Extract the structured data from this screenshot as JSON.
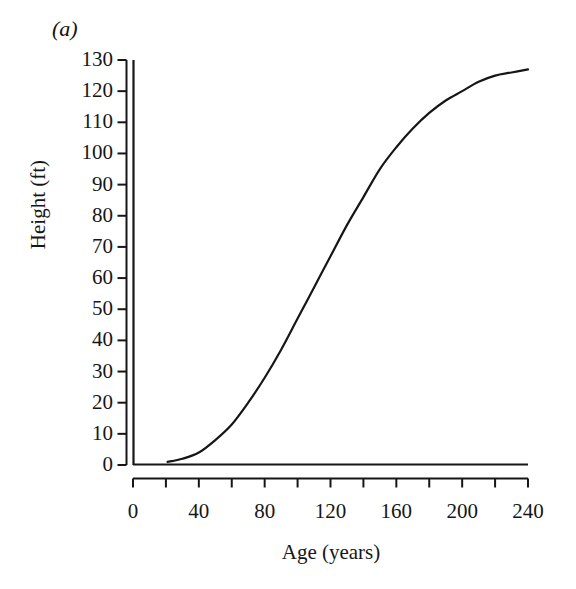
{
  "figure": {
    "panel_label": "(a)",
    "background": "#ffffff",
    "ink_color": "#161616"
  },
  "chart_data": {
    "type": "line",
    "title": "",
    "panel": "(a)",
    "xlabel": "Age (years)",
    "ylabel": "Height (ft)",
    "xlim": [
      0,
      240
    ],
    "ylim": [
      0,
      130
    ],
    "grid": false,
    "legend": null,
    "x_major_ticks": [
      0,
      40,
      80,
      120,
      160,
      200,
      240
    ],
    "x_minor_ticks": [
      20,
      60,
      100,
      140,
      180,
      220
    ],
    "x_tick_labels": [
      "0",
      "40",
      "80",
      "120",
      "160",
      "200",
      "240"
    ],
    "y_ticks": [
      0,
      10,
      20,
      30,
      40,
      50,
      60,
      70,
      80,
      90,
      100,
      110,
      120,
      130
    ],
    "y_tick_labels": [
      "0",
      "10",
      "20",
      "30",
      "40",
      "50",
      "60",
      "70",
      "80",
      "90",
      "100",
      "110",
      "120",
      "130"
    ],
    "series": [
      {
        "name": "Height growth curve",
        "color": "#161616",
        "line_width": 2.2,
        "x": [
          21,
          30,
          40,
          50,
          60,
          70,
          80,
          90,
          100,
          110,
          120,
          130,
          140,
          150,
          160,
          170,
          180,
          190,
          200,
          210,
          220,
          230,
          240
        ],
        "y": [
          1,
          2,
          4,
          8,
          13,
          20,
          28,
          37,
          47,
          57,
          67,
          77,
          86,
          95,
          102,
          108,
          113,
          117,
          120,
          123,
          125,
          126,
          127
        ]
      }
    ]
  }
}
